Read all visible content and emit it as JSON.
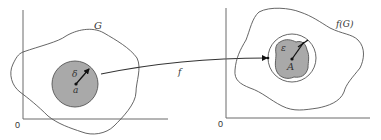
{
  "figure": {
    "left_panel": {
      "origin_label": "0",
      "region_label": "G",
      "neighborhood_radius_label": "δ",
      "center_point_label": "a"
    },
    "mapping": {
      "label": "f"
    },
    "right_panel": {
      "origin_label": "0",
      "region_label": "f(G)",
      "neighborhood_radius_label": "ε",
      "center_point_label": "A"
    },
    "colors": {
      "disc_fill": "#a9a9a9",
      "line": "#555555",
      "background": "#ffffff"
    }
  }
}
